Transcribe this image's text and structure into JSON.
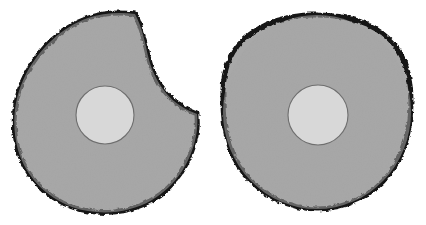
{
  "figure": {
    "background_color": "#ffffff",
    "width": 426,
    "height": 225,
    "shape_count": 2
  },
  "palette": {
    "background": "#ffffff",
    "disc_fill": "#a8a8a8",
    "core_fill": "#d8d8d8",
    "outline": "#121212",
    "core_outline": "#6e6e6e"
  },
  "shapes": [
    {
      "id": "left-disc",
      "label": "Notched disc",
      "complete": false,
      "notch": {
        "present": true,
        "location": "upper-right",
        "description": "Large concave bite removed from upper-right quadrant",
        "start_point": [
          135,
          14
        ],
        "end_point": [
          197,
          114
        ],
        "deepest_point": [
          148,
          70
        ]
      },
      "outer": {
        "center_x": 105,
        "center_y": 112,
        "radius_x": 92,
        "radius_y": 97
      },
      "core": {
        "center_x": 105,
        "center_y": 115,
        "radius_x": 29,
        "radius_y": 29,
        "fill": "#d8d8d8"
      },
      "outline_width": 5
    },
    {
      "id": "right-disc",
      "label": "Complete disc",
      "complete": true,
      "notch": {
        "present": false,
        "location": "",
        "description": "No notch — outline is a closed irregular circle",
        "start_point": [
          0,
          0
        ],
        "end_point": [
          0,
          0
        ],
        "deepest_point": [
          0,
          0
        ]
      },
      "outer": {
        "center_x": 317,
        "center_y": 112,
        "radius_x": 94,
        "radius_y": 97
      },
      "core": {
        "center_x": 318,
        "center_y": 115,
        "radius_x": 30,
        "radius_y": 30,
        "fill": "#d8d8d8"
      },
      "outline_width": 5
    }
  ]
}
